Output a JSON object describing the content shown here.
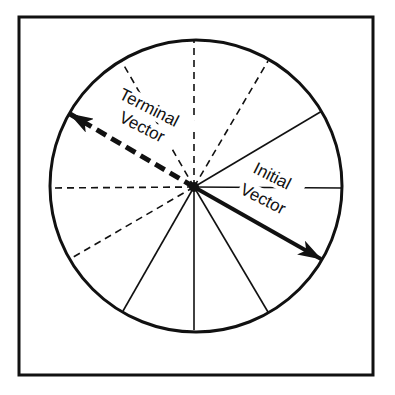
{
  "diagram": {
    "frame": {
      "x": 19,
      "y": 17,
      "width": 354,
      "height": 358
    },
    "circle": {
      "cx": 196,
      "cy": 186,
      "r": 146
    },
    "center": {
      "x": 194,
      "y": 187
    },
    "stroke_color": "#111111",
    "spokes": [
      {
        "name": "spoke-top",
        "x2": 194,
        "y2": 41,
        "style": "dashed"
      },
      {
        "name": "spoke-upper-left",
        "x2": 122,
        "y2": 62,
        "style": "dashed"
      },
      {
        "name": "spoke-upper-right",
        "x2": 268,
        "y2": 61,
        "style": "dashed"
      },
      {
        "name": "spoke-left",
        "x2": 50,
        "y2": 188,
        "style": "dashed"
      },
      {
        "name": "spoke-lower-left-dashed",
        "x2": 70,
        "y2": 259,
        "style": "dashed"
      },
      {
        "name": "spoke-right-upper",
        "x2": 322,
        "y2": 111,
        "style": "solid"
      },
      {
        "name": "spoke-right",
        "x2": 342,
        "y2": 188,
        "style": "solid"
      },
      {
        "name": "spoke-lower-right",
        "x2": 268,
        "y2": 312,
        "style": "solid"
      },
      {
        "name": "spoke-bottom",
        "x2": 194,
        "y2": 330,
        "style": "solid"
      },
      {
        "name": "spoke-lower-left",
        "x2": 123,
        "y2": 311,
        "style": "solid"
      }
    ],
    "vectors": {
      "initial": {
        "label_line1": "Initial",
        "label_line2": "Vector",
        "tip_x": 321,
        "tip_y": 259,
        "style": "solid"
      },
      "terminal": {
        "label_line1": "Terminal",
        "label_line2": "Vector",
        "tip_x": 70,
        "tip_y": 114,
        "style": "dashed"
      }
    }
  }
}
